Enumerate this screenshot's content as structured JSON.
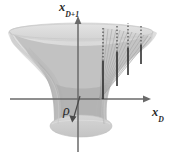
{
  "figure": {
    "kind": "3d-hyperboloid-diagram",
    "background_color": "#ffffff",
    "width": 180,
    "height": 156,
    "labels": {
      "vertical_axis": {
        "base": "x",
        "subscript": "D+1",
        "full": "x_{D+1}"
      },
      "horizontal_axis": {
        "base": "x",
        "subscript": "D",
        "full": "x_D"
      },
      "radius_marker": "ρ"
    },
    "colors": {
      "surface_light": "#dcdcdc",
      "surface_mid": "#c6c6c6",
      "surface_dark": "#b4b4b4",
      "surface_shadow": "#a8a8a8",
      "axis": "#6a6a6a",
      "line": "#3a3a3a",
      "text": "#2b2b2b"
    },
    "axes": {
      "vertical": {
        "x": 78,
        "y_top": 18,
        "y_bottom": 152,
        "arrow": "up"
      },
      "horizontal": {
        "y": 99,
        "x_left": 10,
        "x_right": 148,
        "arrow": "right"
      }
    },
    "fan": {
      "apex": {
        "x": 100,
        "y": 99
      },
      "fiber_count": 4,
      "fibers": [
        {
          "x": 103,
          "solid_top": 61,
          "dotted_top": 27
        },
        {
          "x": 117,
          "solid_top": 52,
          "dotted_top": 24
        },
        {
          "x": 128,
          "solid_top": 48,
          "dotted_top": 23
        },
        {
          "x": 140,
          "solid_top": 45,
          "dotted_top": 25
        }
      ],
      "hatch_count": 16
    },
    "rho_arrow": {
      "from_x": 76,
      "from_y": 114,
      "to_x": 82,
      "to_y": 100
    }
  }
}
